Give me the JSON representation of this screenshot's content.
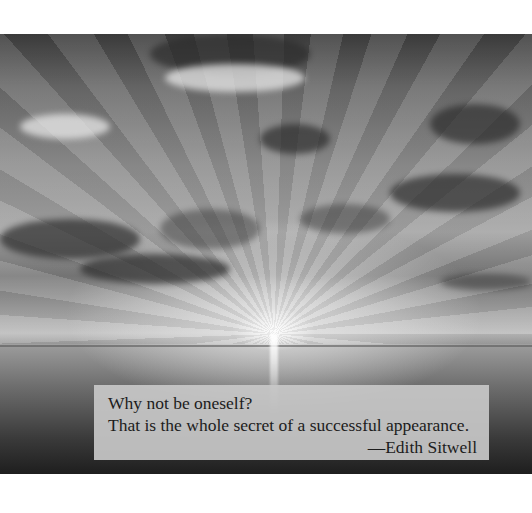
{
  "photo": {
    "description": "Black and white photograph of sun rays bursting through clouds over the sea",
    "icon": "sunset-photo"
  },
  "quote": {
    "line1": "Why not be oneself?",
    "line2": "That is the whole secret of a successful appearance.",
    "attribution": "—Edith Sitwell"
  }
}
